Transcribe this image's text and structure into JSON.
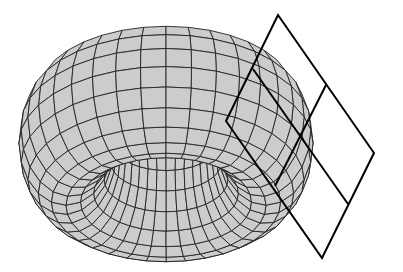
{
  "figure": {
    "background": "#ffffff"
  },
  "torus": {
    "center_x": 166,
    "center_y": 143,
    "major_radius": 100,
    "minor_radius": 47,
    "scale_x": 1.0,
    "scale_y": 0.52,
    "vertical_thickness_scale": 1.55,
    "u_divisions": 36,
    "v_divisions": 20,
    "fill_color": "#cccccc",
    "line_color": "#222222"
  },
  "tangent_plane": {
    "stroke_color": "#000000",
    "stroke_width": 2,
    "outer_quad": [
      [
        278,
        15
      ],
      [
        374,
        153
      ],
      [
        322,
        258
      ],
      [
        226,
        121
      ]
    ],
    "inner_line_top": [
      [
        253,
        69
      ],
      [
        348,
        204
      ]
    ],
    "inner_line_right": [
      [
        326,
        85
      ],
      [
        275,
        186
      ]
    ]
  }
}
